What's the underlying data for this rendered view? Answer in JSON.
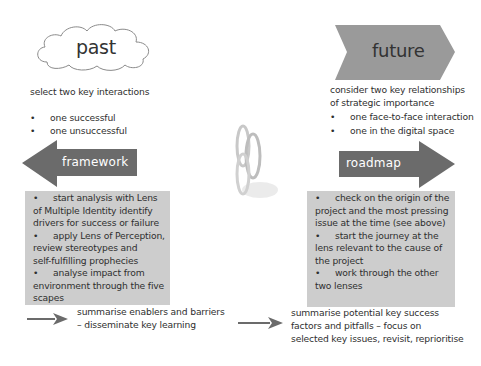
{
  "past": {
    "title": "past",
    "intro": "select two key interactions",
    "bullets": [
      "one successful",
      "one unsuccessful"
    ],
    "bullet_glyph": "•"
  },
  "future": {
    "title": "future",
    "intro_line1": "consider two key relationships",
    "intro_line2": "of strategic importance",
    "bullets": [
      "one face-to-face interaction",
      "one in the digital space"
    ],
    "bullet_glyph": "•"
  },
  "framework": {
    "label": "framework",
    "box_lines": [
      {
        "bullet": "•",
        "text": "start analysis with Lens"
      },
      {
        "bullet": "",
        "text": "of Multiple Identity identify"
      },
      {
        "bullet": "",
        "text": "drivers for success or failure"
      },
      {
        "bullet": "•",
        "text": "apply Lens of Perception,"
      },
      {
        "bullet": "",
        "text": "review stereotypes and"
      },
      {
        "bullet": "",
        "text": "self-fulfilling prophecies"
      },
      {
        "bullet": "•",
        "text": "analyse impact from"
      },
      {
        "bullet": "",
        "text": "environment through the five"
      },
      {
        "bullet": "",
        "text": "scapes"
      }
    ],
    "summary_line1": "summarise enablers and barriers",
    "summary_line2": "– disseminate key learning"
  },
  "roadmap": {
    "label": "roadmap",
    "box_lines": [
      {
        "bullet": "•",
        "text": "check on the origin of the"
      },
      {
        "bullet": "",
        "text": "project and the most pressing"
      },
      {
        "bullet": "",
        "text": "issue at the time (see above)"
      },
      {
        "bullet": "•",
        "text": "start the journey at the"
      },
      {
        "bullet": "",
        "text": "lens relevant to the cause of"
      },
      {
        "bullet": "",
        "text": "the project"
      },
      {
        "bullet": "•",
        "text": "work through the other"
      },
      {
        "bullet": "",
        "text": "two lenses"
      }
    ],
    "summary_line1": "summarise potential key success",
    "summary_line2": "factors and pitfalls – focus on",
    "summary_line3": "selected key issues, revisit, reprioritise"
  },
  "center_image": {
    "icon": "interlocking-rings-icon"
  },
  "colors": {
    "arrow_dark": "#6b6b6b",
    "chevron_grey": "#9a9a9a",
    "box_grey": "#cdcdcd",
    "text": "#2f2f2f"
  }
}
